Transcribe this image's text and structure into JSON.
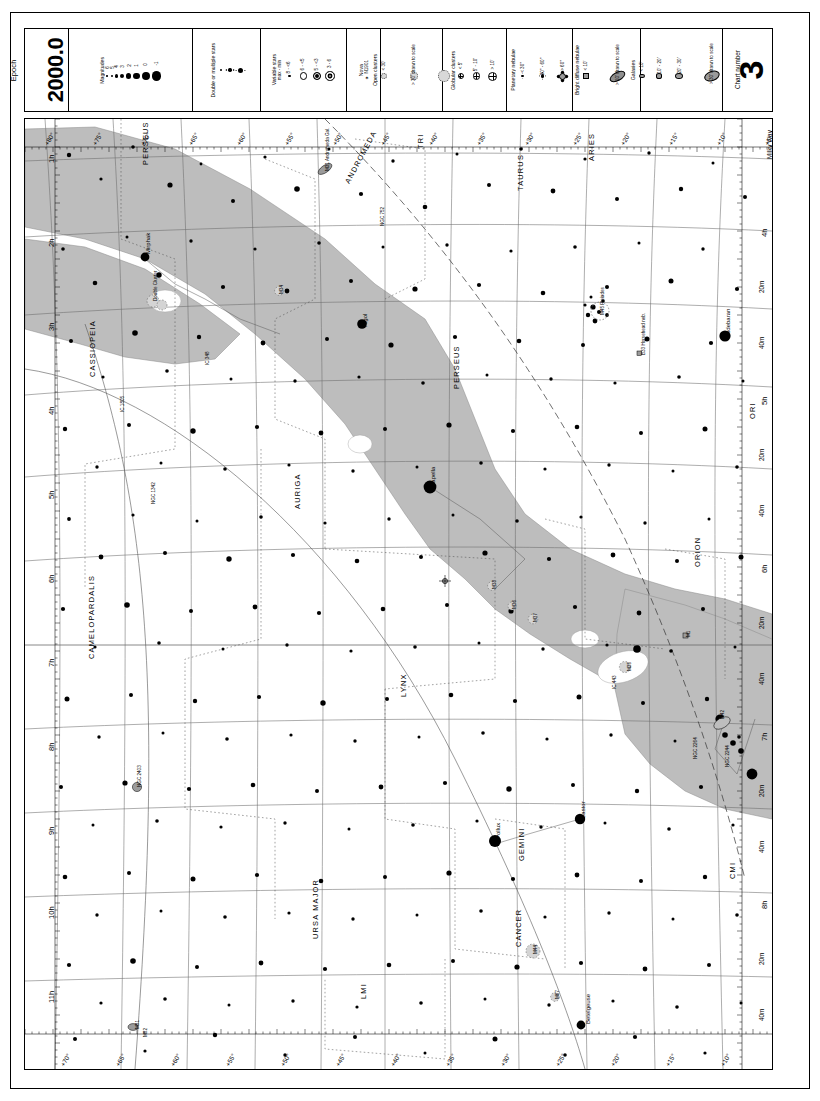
{
  "chart": {
    "epoch_word": "Epoch",
    "epoch_value": "2000.0",
    "chart_number_label": "Chart number",
    "chart_number": "3",
    "milky_way_label": "Milky Way"
  },
  "legend": {
    "magnitudes": {
      "title": "Magnitudes",
      "values": [
        "6",
        "5",
        "4",
        "3",
        "2",
        "1",
        "0",
        "-1"
      ],
      "sizes": [
        1.6,
        2.3,
        3.1,
        4.1,
        5.2,
        6.4,
        7.8,
        9.4
      ]
    },
    "double": {
      "title": "Double or multiple stars",
      "sizes": [
        2.2,
        3.4,
        5.0
      ]
    },
    "variable": {
      "title": "Variable stars",
      "subtitle": "max - min",
      "values": [
        "8 - <6",
        "6 - <5",
        "5 - <3",
        "3 - 6"
      ]
    },
    "nova": {
      "title": "Nova",
      "value": "✶ N1901"
    },
    "open_clusters": {
      "title": "Open clusters",
      "values": [
        "< 30'",
        "> 30' drawn to scale"
      ],
      "sizes": [
        4.0,
        6.2,
        9.6
      ]
    },
    "globular_clusters": {
      "title": "Globular clusters",
      "values": [
        "< 5'",
        "5' - 10'",
        "> 10'"
      ],
      "sizes": [
        4.0,
        5.4,
        7.0
      ]
    },
    "planetary_nebulae": {
      "title": "Planetary nebulae",
      "values": [
        "< 30\"",
        "30\" - 60\"",
        "> 60\""
      ],
      "sizes": [
        4.0,
        5.4,
        7.0
      ]
    },
    "bright_diffuse_nebulae": {
      "title": "Bright diffuse nebulae",
      "values": [
        "< 10'",
        "> 10' drawn to scale"
      ]
    },
    "galaxies": {
      "title": "Galaxies",
      "values": [
        "< 10'",
        "10' - 20'",
        "20' - 30'",
        "> 30' drawn to scale"
      ],
      "sizes": [
        3.4,
        4.6,
        5.8,
        11.0
      ]
    }
  },
  "axes": {
    "ra_label_suffix": "h",
    "ra_left": [
      "1",
      "2",
      "3",
      "4",
      "5",
      "6",
      "7",
      "8",
      "9",
      "10",
      "11"
    ],
    "ra_right": [
      "4",
      "5",
      "6",
      "7",
      "8"
    ],
    "ra_right_minor": [
      "20",
      "40"
    ],
    "ra_minor_suffix": "m",
    "dec_bottom": [
      "+70°",
      "+65°",
      "+60°",
      "+55°",
      "+50°",
      "+45°",
      "+40°",
      "+35°",
      "+30°",
      "+25°",
      "+20°",
      "+15°",
      "+10°"
    ],
    "dec_top": [
      "+80°",
      "+75°",
      "+70°",
      "+65°",
      "+60°",
      "+55°",
      "+50°",
      "+45°",
      "+40°",
      "+35°",
      "+30°",
      "+25°",
      "+20°",
      "+15°",
      "+10°",
      "+5°"
    ]
  },
  "constellations": [
    {
      "name": "ANDROMEDA",
      "x": 318,
      "y": 62,
      "rot": -62
    },
    {
      "name": "PERSEUS",
      "x": 116,
      "y": 46,
      "rot": -90
    },
    {
      "name": "TRI",
      "x": 391,
      "y": 30,
      "rot": -90
    },
    {
      "name": "ARIES",
      "x": 562,
      "y": 42,
      "rot": -90
    },
    {
      "name": "TAURUS",
      "x": 491,
      "y": 72,
      "rot": -90
    },
    {
      "name": "CASSIOPEIA",
      "x": 63,
      "y": 258,
      "rot": -90
    },
    {
      "name": "PERSEUS",
      "x": 427,
      "y": 270,
      "rot": -90
    },
    {
      "name": "ORI",
      "x": 723,
      "y": 300,
      "rot": -90
    },
    {
      "name": "AURIGA",
      "x": 268,
      "y": 390,
      "rot": -90
    },
    {
      "name": "ORION",
      "x": 668,
      "y": 448,
      "rot": -90
    },
    {
      "name": "CAMELOPARDALIS",
      "x": 62,
      "y": 540,
      "rot": -90
    },
    {
      "name": "LYNX",
      "x": 374,
      "y": 578,
      "rot": -90
    },
    {
      "name": "GEMINI",
      "x": 492,
      "y": 742,
      "rot": -90
    },
    {
      "name": "CANCER",
      "x": 489,
      "y": 828,
      "rot": -90
    },
    {
      "name": "CMI",
      "x": 703,
      "y": 760,
      "rot": -90
    },
    {
      "name": "URSA MAJOR",
      "x": 286,
      "y": 820,
      "rot": -90
    },
    {
      "name": "LMI",
      "x": 334,
      "y": 880,
      "rot": -90
    }
  ],
  "named_stars": [
    {
      "name": "Algol",
      "x": 337,
      "y": 208,
      "rot": -90
    },
    {
      "name": "Capella",
      "x": 405,
      "y": 368,
      "rot": -90
    },
    {
      "name": "Aldebaran",
      "x": 700,
      "y": 217,
      "rot": -90
    },
    {
      "name": "Castor",
      "x": 555,
      "y": 700,
      "rot": -90
    },
    {
      "name": "Pollux",
      "x": 470,
      "y": 720,
      "rot": -90
    },
    {
      "name": "Betelgeuse",
      "x": 560,
      "y": 905,
      "rot": -90
    },
    {
      "name": "Mirphak",
      "x": 120,
      "y": 135,
      "rot": -90
    }
  ],
  "deep_sky_labels": [
    {
      "name": "M45 Pleiades",
      "x": 575,
      "y": 196,
      "rot": -90
    },
    {
      "name": "M31 Andromeda Gal.",
      "x": 300,
      "y": 52,
      "rot": -90
    },
    {
      "name": "Double Cluster",
      "x": 128,
      "y": 182,
      "rot": -90
    },
    {
      "name": "M34",
      "x": 254,
      "y": 175,
      "rot": -90
    },
    {
      "name": "M38",
      "x": 467,
      "y": 470,
      "rot": -90
    },
    {
      "name": "M36",
      "x": 487,
      "y": 490,
      "rot": -90
    },
    {
      "name": "M37",
      "x": 508,
      "y": 503,
      "rot": -90
    },
    {
      "name": "M35",
      "x": 602,
      "y": 552,
      "rot": -90
    },
    {
      "name": "M42",
      "x": 695,
      "y": 600,
      "rot": -90
    },
    {
      "name": "M44",
      "x": 508,
      "y": 835,
      "rot": -90
    },
    {
      "name": "M67",
      "x": 530,
      "y": 880,
      "rot": -90
    },
    {
      "name": "M1",
      "x": 661,
      "y": 518,
      "rot": -90
    },
    {
      "name": "M81",
      "x": 110,
      "y": 910,
      "rot": -90
    },
    {
      "name": "M82",
      "x": 118,
      "y": 918,
      "rot": -90
    },
    {
      "name": "IC 1805",
      "x": 95,
      "y": 293,
      "rot": -90
    },
    {
      "name": "IC 348",
      "x": 180,
      "y": 246,
      "rot": -90
    },
    {
      "name": "NGC 752",
      "x": 355,
      "y": 107,
      "rot": -90
    },
    {
      "name": "NGC 1342",
      "x": 126,
      "y": 385,
      "rot": -90
    },
    {
      "name": "NGC 2403",
      "x": 112,
      "y": 668,
      "rot": -90
    },
    {
      "name": "NGC 2264",
      "x": 668,
      "y": 640,
      "rot": -90
    },
    {
      "name": "NGC 2244",
      "x": 700,
      "y": 648,
      "rot": -90
    },
    {
      "name": "B33 Horsehead neb.",
      "x": 616,
      "y": 236,
      "rot": -90
    },
    {
      "name": "IC 443",
      "x": 587,
      "y": 570,
      "rot": -90
    }
  ]
}
